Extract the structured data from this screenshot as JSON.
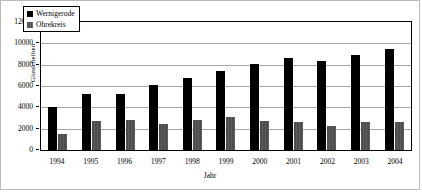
{
  "chart_data": {
    "type": "bar",
    "title": "",
    "xlabel": "Jahr",
    "ylabel": "Glasscheiben",
    "categories": [
      "1994",
      "1995",
      "1996",
      "1997",
      "1998",
      "1999",
      "2000",
      "2001",
      "2002",
      "2003",
      "2004"
    ],
    "series": [
      {
        "name": "Wernigerode",
        "color": "#000000",
        "values": [
          4050,
          5300,
          5250,
          6100,
          6800,
          7400,
          8100,
          8650,
          8350,
          8900,
          9500
        ]
      },
      {
        "name": "Ohrekreis",
        "color": "#4d4d4d",
        "values": [
          1550,
          2700,
          2850,
          2450,
          2800,
          3100,
          2700,
          2650,
          2300,
          2600,
          2650
        ]
      }
    ],
    "ylim": [
      0,
      12000
    ],
    "yticks": [
      0,
      2000,
      4000,
      6000,
      8000,
      10000,
      12000
    ],
    "ytick_labels": [
      "0",
      "2000",
      "4000",
      "6000",
      "8000",
      "10000",
      "12000"
    ],
    "grid": true,
    "legend_position": "top-left"
  }
}
